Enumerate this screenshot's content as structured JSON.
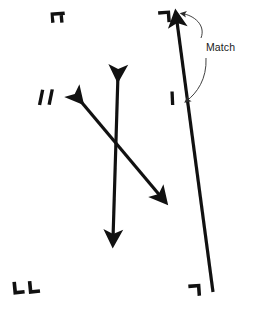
{
  "figure": {
    "title": "Match",
    "background_color": "#ffffff",
    "ink_color": "#111111",
    "thin_ink_color": "#2b2b2b",
    "width": 259,
    "height": 317,
    "annotations": {
      "match_label": {
        "text": "Match",
        "x": 206,
        "y": 48,
        "font_size": 10.5
      }
    },
    "registration_marks": [
      {
        "name": "top-left-crop-mark",
        "glyph": "pi-bracket",
        "x": 56,
        "y": 14
      },
      {
        "name": "bottom-left-crop-mark",
        "glyph": "double-L-corner",
        "x": 16,
        "y": 290
      },
      {
        "name": "top-right-crop-mark",
        "glyph": "reverse-L-corner",
        "x": 162,
        "y": 17
      },
      {
        "name": "bottom-right-crop-mark",
        "glyph": "reverse-L-corner",
        "x": 192,
        "y": 290
      },
      {
        "name": "left-slash-pair-mark",
        "glyph": "double-slash",
        "x": 44,
        "y": 97
      },
      {
        "name": "mid-tick-mark",
        "glyph": "short-vertical-tick",
        "x": 172,
        "y": 98
      }
    ],
    "shapes": [
      {
        "name": "vertical-double-arrow",
        "kind": "double-headed-arrow",
        "x1": 118,
        "y1": 70,
        "x2": 113,
        "y2": 243,
        "stroke_width": 3.2
      },
      {
        "name": "diagonal-double-arrow",
        "kind": "double-headed-arrow",
        "x1": 74,
        "y1": 94,
        "x2": 166,
        "y2": 202,
        "stroke_width": 3.2
      },
      {
        "name": "long-right-line",
        "kind": "single-headed-arrow",
        "x1": 213,
        "y1": 292,
        "x2": 176,
        "y2": 14,
        "stroke_width": 3.2
      }
    ],
    "leaders": [
      {
        "name": "match-leader-upper",
        "path": "M 200 40 C 205 26 193 16 180 14",
        "target": "long-right-line-arrowhead"
      },
      {
        "name": "match-leader-lower",
        "path": "M 205 58 C 205 78 196 92 184 101",
        "target": "long-right-line-midpoint"
      }
    ]
  }
}
